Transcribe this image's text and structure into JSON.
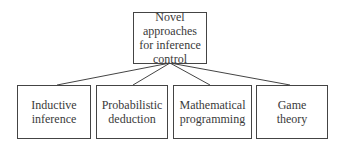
{
  "diagram": {
    "root": {
      "label": "Novel\napproaches\nfor inference\ncontrol"
    },
    "children": [
      {
        "label": "Inductive\ninference"
      },
      {
        "label": "Probabilistic\ndeduction"
      },
      {
        "label": "Mathematical\nprogramming"
      },
      {
        "label": "Game\ntheory"
      }
    ]
  }
}
